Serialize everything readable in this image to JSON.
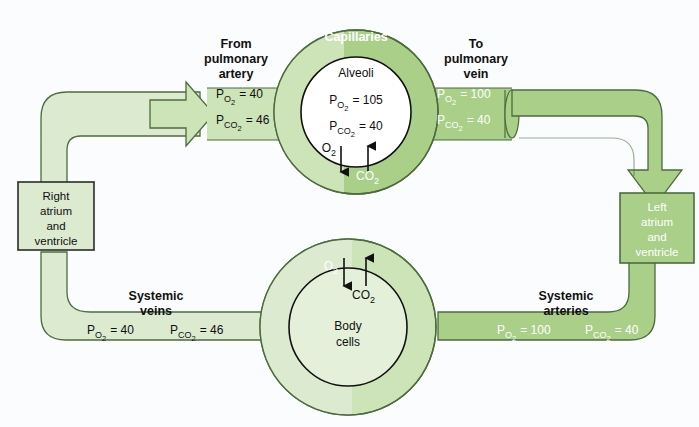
{
  "diagram": {
    "background_color": "#fbfcfe",
    "colors": {
      "pale_green": "#dcead0",
      "mid_green": "#cde3b8",
      "dark_green": "#a9cf88",
      "outline": "#4d6b3c",
      "dark_text": "#101010",
      "light_text": "#ffffff"
    }
  },
  "labels": {
    "from_pulmonary_artery": "From\npulmonary\nartery",
    "from_pulmonary_artery_l1": "From",
    "from_pulmonary_artery_l2": "pulmonary",
    "from_pulmonary_artery_l3": "artery",
    "to_pulmonary_vein_l1": "To",
    "to_pulmonary_vein_l2": "pulmonary",
    "to_pulmonary_vein_l3": "vein",
    "capillaries": "Capillaries",
    "alveoli": "Alveoli",
    "body_cells_l1": "Body",
    "body_cells_l2": "cells",
    "systemic_veins_l1": "Systemic",
    "systemic_veins_l2": "veins",
    "systemic_arteries_l1": "Systemic",
    "systemic_arteries_l2": "arteries",
    "right_heart_l1": "Right",
    "right_heart_l2": "atrium",
    "right_heart_l3": "and",
    "right_heart_l4": "ventricle",
    "left_heart_l1": "Left",
    "left_heart_l2": "atrium",
    "left_heart_l3": "and",
    "left_heart_l4": "ventricle"
  },
  "gas_symbols": {
    "o2": "O",
    "o2_sub": "2",
    "co2": "CO",
    "co2_sub": "2",
    "p": "P",
    "equals": "="
  },
  "values": {
    "deoxygenated_blood": {
      "po2_label": "P",
      "po2_sub": "O",
      "po2_sub2": "2",
      "po2_value": "= 40",
      "pco2_label": "P",
      "pco2_sub": "CO",
      "pco2_sub2": "2",
      "pco2_value": "= 46"
    },
    "oxygenated_blood": {
      "po2_value": "= 100",
      "pco2_value": "= 40"
    },
    "alveolar_air": {
      "po2_value": "= 105",
      "pco2_value": "= 40"
    },
    "systemic_veins": {
      "po2_value": "= 40",
      "pco2_value": "= 46"
    },
    "systemic_arteries": {
      "po2_value": "= 100",
      "pco2_value": "= 40"
    }
  },
  "exchange": {
    "alveolar": {
      "o2_direction": "down",
      "co2_direction": "up"
    },
    "tissue": {
      "o2_direction": "down",
      "co2_direction": "up"
    }
  }
}
